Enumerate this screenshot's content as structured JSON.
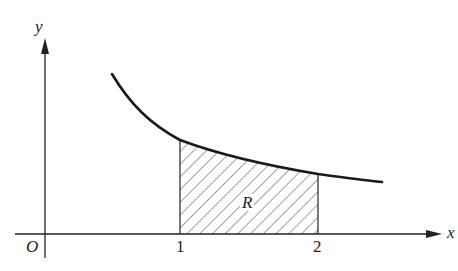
{
  "diagram": {
    "type": "area-under-curve",
    "colors": {
      "ink": "#222222",
      "curve": "#1a1a1a",
      "hatch": "#444444",
      "background": "#ffffff"
    },
    "axes": {
      "x_label": "x",
      "y_label": "y",
      "origin_label": "O"
    },
    "ticks": [
      {
        "value": "1",
        "label": "1"
      },
      {
        "value": "2",
        "label": "2"
      }
    ],
    "region": {
      "label": "R",
      "x_from": 1,
      "x_to": 2,
      "fill": "diagonal-hatch"
    },
    "curve": {
      "shape": "decreasing, concave up",
      "points_px": [
        [
          112,
          74
        ],
        [
          130,
          100
        ],
        [
          155,
          123
        ],
        [
          180,
          140
        ],
        [
          220,
          155
        ],
        [
          260,
          164
        ],
        [
          318,
          174
        ],
        [
          382,
          182
        ]
      ]
    }
  }
}
